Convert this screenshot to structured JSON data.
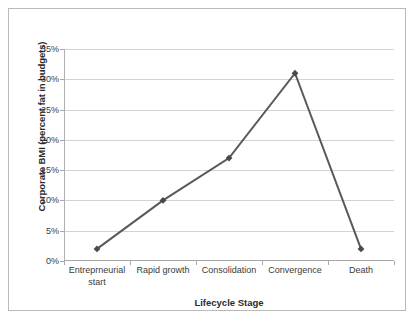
{
  "chart_data": {
    "type": "line",
    "title": "",
    "xlabel": "Lifecycle Stage",
    "ylabel": "Corporate BMI (percent fat in budgets)",
    "categories": [
      "Entreprneurial start",
      "Rapid growth",
      "Consolidation",
      "Convergence",
      "Death"
    ],
    "category_lines": [
      [
        "Entreprneurial",
        "start"
      ],
      [
        "Rapid growth",
        ""
      ],
      [
        "Consolidation",
        ""
      ],
      [
        "Convergence",
        ""
      ],
      [
        "Death",
        ""
      ]
    ],
    "values": [
      2,
      10,
      17,
      31,
      2
    ],
    "ylim": [
      0,
      35
    ],
    "ytick_values": [
      0,
      5,
      10,
      15,
      20,
      25,
      30,
      35
    ],
    "ytick_labels": [
      "0%",
      "5%",
      "10%",
      "15%",
      "20%",
      "25%",
      "30%",
      "35%"
    ],
    "grid": true,
    "legend": false,
    "series": [
      {
        "name": "Corporate BMI",
        "values": [
          2,
          10,
          17,
          31,
          2
        ],
        "marker": "diamond",
        "color": "#595959"
      }
    ]
  },
  "style": {
    "line_color": "#595959",
    "marker_color": "#4a4a4a",
    "gridline_color": "#d3d3d3",
    "axis_color": "#a8a8a8",
    "border_color": "#b9b9b9",
    "text_color": "#3a3a3a",
    "background": "#ffffff"
  }
}
